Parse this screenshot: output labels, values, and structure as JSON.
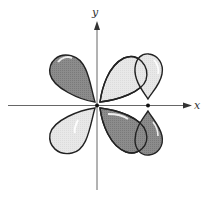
{
  "diagram": {
    "type": "orbital-overlap",
    "axes": {
      "x_label": "x",
      "y_label": "y"
    },
    "colors": {
      "dark_lobe": "#8a8a8a",
      "light_lobe": "#e6e6e6",
      "outline": "#222222",
      "axis": "#555555"
    },
    "lobes": [
      {
        "name": "d-lobe-upper-left",
        "phase": "dark"
      },
      {
        "name": "d-lobe-upper-right",
        "phase": "light"
      },
      {
        "name": "d-lobe-lower-left",
        "phase": "light"
      },
      {
        "name": "d-lobe-lower-right",
        "phase": "dark"
      },
      {
        "name": "p-lobe-upper",
        "phase": "light"
      },
      {
        "name": "p-lobe-lower",
        "phase": "dark"
      }
    ],
    "points": [
      {
        "name": "origin-nucleus"
      },
      {
        "name": "second-nucleus"
      }
    ]
  }
}
